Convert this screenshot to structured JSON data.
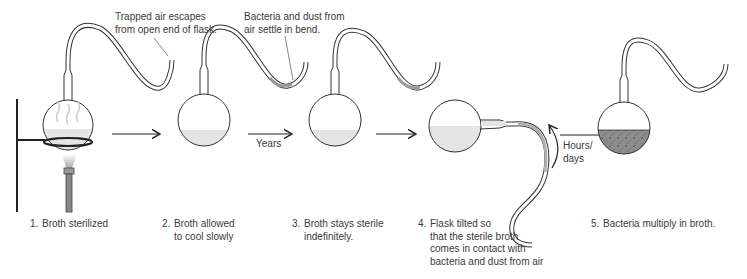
{
  "diagram": {
    "colors": {
      "outline": "#333333",
      "broth": "#e4e4e4",
      "contaminated_broth": "#8c8c8c",
      "dust_in_bend": "#9a9a9a",
      "arrow": "#222222"
    },
    "callouts": [
      {
        "id": "trapped-air",
        "lines": [
          "Trapped air escapes",
          "from open end of flask."
        ]
      },
      {
        "id": "bacteria-dust",
        "lines": [
          "Bacteria and dust from",
          "air settle in bend."
        ]
      }
    ],
    "transitions": [
      {
        "from": 1,
        "to": 2,
        "label": ""
      },
      {
        "from": 2,
        "to": 3,
        "label": "Years"
      },
      {
        "from": 3,
        "to": 4,
        "label": ""
      },
      {
        "from": 4,
        "to": 5,
        "label_lines": [
          "Hours/",
          "days"
        ]
      }
    ],
    "steps": [
      {
        "num": "1.",
        "lines": [
          "Broth sterilized"
        ]
      },
      {
        "num": "2.",
        "lines": [
          "Broth allowed",
          "to cool slowly"
        ]
      },
      {
        "num": "3.",
        "lines": [
          "Broth stays sterile",
          "indefinitely."
        ]
      },
      {
        "num": "4.",
        "lines": [
          "Flask tilted so",
          "that the sterile broth",
          "comes in contact with",
          "bacteria and dust from air"
        ]
      },
      {
        "num": "5.",
        "lines": [
          "Bacteria multiply in broth."
        ]
      }
    ]
  }
}
